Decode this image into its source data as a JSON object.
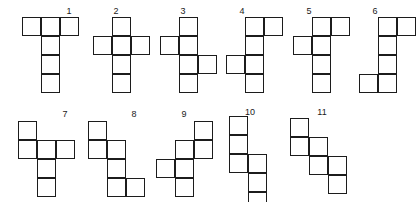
{
  "figure": {
    "cell_size_px": 19,
    "stroke_color": "#1c1c1c",
    "fill_color": "#ffffff",
    "label_color": "#1a1a1a",
    "background": "#ffffff"
  },
  "nets": [
    {
      "label": "1",
      "origin": [
        22,
        17
      ],
      "label_pos": [
        59,
        6
      ],
      "cells": [
        [
          0,
          0
        ],
        [
          1,
          0
        ],
        [
          2,
          0
        ],
        [
          1,
          1
        ],
        [
          1,
          2
        ],
        [
          1,
          3
        ]
      ],
      "description": "T-shape: three cells across the top, three descending from the middle column"
    },
    {
      "label": "2",
      "origin": [
        93,
        17
      ],
      "label_pos": [
        106,
        6
      ],
      "cells": [
        [
          1,
          0
        ],
        [
          0,
          1
        ],
        [
          1,
          1
        ],
        [
          2,
          1
        ],
        [
          1,
          2
        ],
        [
          1,
          3
        ]
      ],
      "description": "Latin cross: vertical column of four with one cell on each side of row two"
    },
    {
      "label": "3",
      "origin": [
        160,
        17
      ],
      "label_pos": [
        173,
        6
      ],
      "cells": [
        [
          1,
          0
        ],
        [
          0,
          1
        ],
        [
          1,
          1
        ],
        [
          1,
          2
        ],
        [
          2,
          2
        ],
        [
          1,
          3
        ]
      ],
      "description": "Vertical column of four, left tab at row two, right tab at row three"
    },
    {
      "label": "4",
      "origin": [
        226,
        17
      ],
      "label_pos": [
        232,
        6
      ],
      "cells": [
        [
          1,
          0
        ],
        [
          2,
          0
        ],
        [
          1,
          1
        ],
        [
          0,
          2
        ],
        [
          1,
          2
        ],
        [
          1,
          3
        ]
      ],
      "description": "Vertical column of four, right tab at row one, left tab at row three"
    },
    {
      "label": "5",
      "origin": [
        293,
        17
      ],
      "label_pos": [
        299,
        6
      ],
      "cells": [
        [
          1,
          0
        ],
        [
          2,
          0
        ],
        [
          0,
          1
        ],
        [
          1,
          1
        ],
        [
          1,
          2
        ],
        [
          1,
          3
        ]
      ],
      "description": "Vertical column of four, right tab at row one, left tab at row two"
    },
    {
      "label": "6",
      "origin": [
        359,
        17
      ],
      "label_pos": [
        365,
        6
      ],
      "cells": [
        [
          1,
          0
        ],
        [
          2,
          0
        ],
        [
          1,
          1
        ],
        [
          1,
          2
        ],
        [
          0,
          3
        ],
        [
          1,
          3
        ]
      ],
      "description": "Vertical column of four, right tab at row one, left tab at row four"
    },
    {
      "label": "7",
      "origin": [
        18,
        121
      ],
      "label_pos": [
        55,
        109
      ],
      "cells": [
        [
          0,
          0
        ],
        [
          0,
          1
        ],
        [
          1,
          1
        ],
        [
          2,
          1
        ],
        [
          1,
          2
        ],
        [
          1,
          3
        ]
      ],
      "description": "Cell above left end of a horizontal row of three, two cells below the middle column"
    },
    {
      "label": "8",
      "origin": [
        88,
        121
      ],
      "label_pos": [
        124,
        109
      ],
      "cells": [
        [
          0,
          0
        ],
        [
          0,
          1
        ],
        [
          1,
          1
        ],
        [
          1,
          2
        ],
        [
          1,
          3
        ],
        [
          2,
          3
        ]
      ],
      "description": "Staircase: two cells in column one, three in column two, one in column three"
    },
    {
      "label": "9",
      "origin": [
        156,
        121
      ],
      "label_pos": [
        174,
        109
      ],
      "cells": [
        [
          2,
          0
        ],
        [
          1,
          1
        ],
        [
          2,
          1
        ],
        [
          0,
          2
        ],
        [
          1,
          2
        ],
        [
          1,
          3
        ]
      ],
      "description": "Zigzag with a left tab at row three and a right tab at rows one and two"
    },
    {
      "label": "10",
      "origin": [
        229,
        116
      ],
      "label_pos": [
        240,
        107
      ],
      "cells": [
        [
          0,
          0
        ],
        [
          0,
          1
        ],
        [
          0,
          2
        ],
        [
          1,
          2
        ],
        [
          1,
          3
        ],
        [
          1,
          4
        ]
      ],
      "description": "Long staircase: three cells in column one, three in column two, overlapping at row three"
    },
    {
      "label": "11",
      "origin": [
        290,
        118
      ],
      "label_pos": [
        312,
        107
      ],
      "cells": [
        [
          0,
          0
        ],
        [
          0,
          1
        ],
        [
          1,
          1
        ],
        [
          1,
          2
        ],
        [
          2,
          2
        ],
        [
          2,
          3
        ]
      ],
      "description": "Diagonal staircase of three stacked domino steps"
    }
  ]
}
